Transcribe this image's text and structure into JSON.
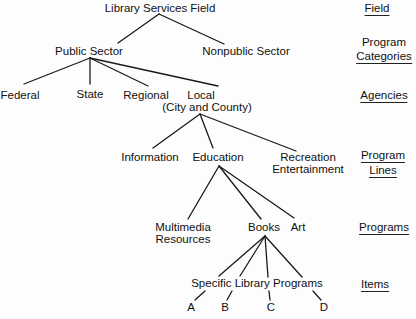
{
  "tree": {
    "root": "Library Services Field",
    "categories": [
      "Public Sector",
      "Nonpublic Sector"
    ],
    "agencies": [
      "Federal",
      "State",
      "Regional",
      "Local",
      "(City and County)"
    ],
    "program_lines": [
      "Information",
      "Education",
      "Recreation",
      "Entertainment"
    ],
    "programs": [
      "Multimedia",
      "Resources",
      "Books",
      "Art"
    ],
    "items_label": "Specific Library Programs",
    "items": [
      "A",
      "B",
      "C",
      "D"
    ]
  },
  "levels": {
    "field": "Field",
    "program_categories": [
      "Program",
      "Categories"
    ],
    "agencies": "Agencies",
    "program_lines": [
      "Program",
      "Lines"
    ],
    "programs": "Programs",
    "items": "Items"
  }
}
